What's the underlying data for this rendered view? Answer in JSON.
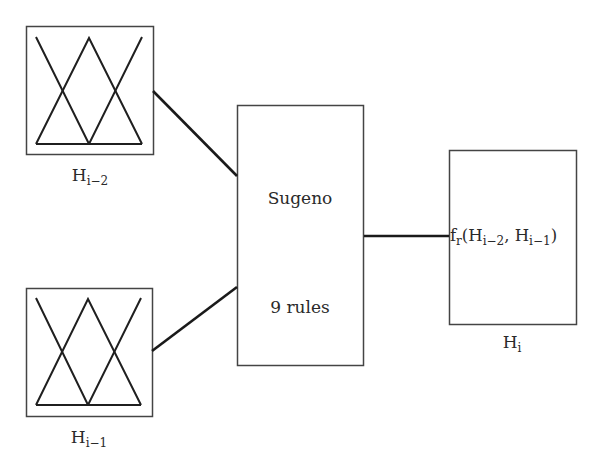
{
  "diagram": {
    "type": "fuzzy-inference-block-diagram",
    "inputs": [
      {
        "id": "input-top",
        "label_base": "H",
        "label_sub": "i−2",
        "membership_functions": 3,
        "membership_shape": "triangular"
      },
      {
        "id": "input-bottom",
        "label_base": "H",
        "label_sub": "i−1",
        "membership_functions": 3,
        "membership_shape": "triangular"
      }
    ],
    "inference": {
      "title": "Sugeno",
      "rules": "9 rules"
    },
    "output": {
      "func_base": "f",
      "func_sub": "r",
      "arg_open": "(H",
      "arg1_sub": "i−2",
      "arg_sep": ", H",
      "arg2_sub": "i−1",
      "arg_close": ")",
      "label_base": "H",
      "label_sub": "i"
    },
    "colors": {
      "line": "#1a1a1a",
      "box_border": "#444444",
      "text": "#2a2a2a"
    }
  }
}
